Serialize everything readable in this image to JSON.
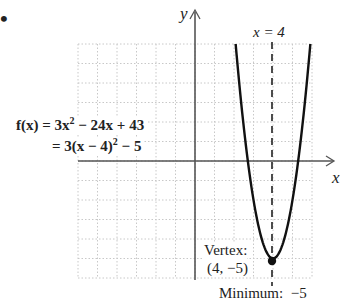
{
  "bullet": "•",
  "axes": {
    "x_label": "x",
    "y_label": "y"
  },
  "function": {
    "name": "f(x)",
    "standard_form": {
      "lhs": "f(x) = 3x",
      "exp": "2",
      "rest": " − 24x + 43"
    },
    "vertex_form": {
      "pre": "= 3(x − 4)",
      "exp": "2",
      "post": " − 5"
    }
  },
  "axis_of_symmetry": {
    "label": "x = 4",
    "value": 4
  },
  "vertex": {
    "title": "Vertex:",
    "coords": "(4, −5)",
    "x": 4,
    "y": -5
  },
  "minimum": {
    "label": "Minimum:",
    "value": "−5"
  },
  "colors": {
    "curve": "#111111",
    "axis": "#555555",
    "grid": "#c8c8c8"
  },
  "chart_data": {
    "type": "line",
    "title": "",
    "xlabel": "x",
    "ylabel": "y",
    "function": "f(x) = 3x^2 - 24x + 43 = 3(x - 4)^2 - 5",
    "xlim": [
      -6,
      6
    ],
    "ylim": [
      -6,
      6
    ],
    "grid": true,
    "annotations": [
      "x = 4",
      "Vertex: (4, −5)",
      "Minimum: −5"
    ],
    "series": [
      {
        "name": "f(x)",
        "x": [
          2.1,
          2.5,
          3,
          3.5,
          4,
          4.5,
          5,
          5.5,
          5.9
        ],
        "y": [
          5.83,
          1.75,
          -2,
          -4.25,
          -5,
          -4.25,
          -2,
          1.75,
          5.83
        ]
      }
    ],
    "vertex": [
      4,
      -5
    ],
    "axis_of_symmetry": 4
  }
}
